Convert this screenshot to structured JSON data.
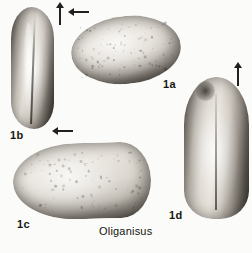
{
  "plate": {
    "caption": "Oliganisus",
    "background_color": "#fbfbfa",
    "ink_color": "#17150f",
    "width": 252,
    "height": 253
  },
  "figures": [
    {
      "id": "1a",
      "label": "1a",
      "view": "dorsal-view-elongate-oval",
      "arrow": {
        "name": "direction-arrow-1a",
        "glyph": "left-arrow"
      }
    },
    {
      "id": "1b",
      "label": "1b",
      "view": "lateral-view-tall-valve",
      "arrow": {
        "name": "direction-arrow-1b",
        "glyph": "up-arrow"
      }
    },
    {
      "id": "1c",
      "label": "1c",
      "view": "dorsal-view-broad-valve",
      "arrow": {
        "name": "direction-arrow-1c",
        "glyph": "left-arrow"
      }
    },
    {
      "id": "1d",
      "label": "1d",
      "view": "lateral-view-rounded-valve",
      "arrow": {
        "name": "direction-arrow-1d",
        "glyph": "up-arrow"
      }
    }
  ]
}
